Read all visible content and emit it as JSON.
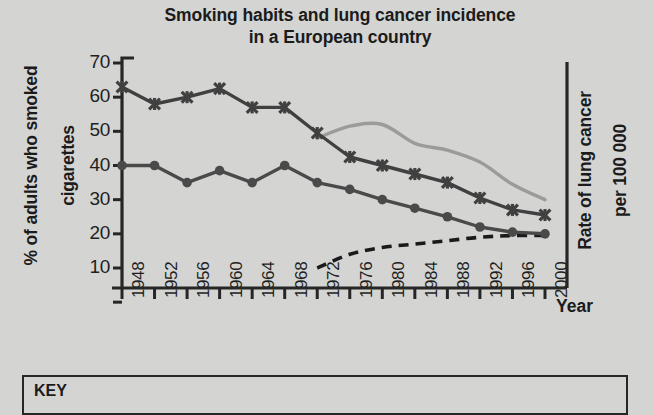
{
  "title": {
    "line1": "Smoking habits and lung cancer incidence",
    "line2": "in a European country"
  },
  "axes": {
    "left_title_line1": "% of adults who smoked",
    "left_title_line2": "cigarettes",
    "right_title_line1": "Rate of lung cancer",
    "right_title_line2": "per 100 000",
    "x_title": "Year"
  },
  "key": {
    "label": "KEY"
  },
  "chart_data": {
    "type": "line",
    "title": "Smoking habits and lung cancer incidence in a European country",
    "xlabel": "Year",
    "ylabel": "% of adults who smoked cigarettes",
    "ylabel_right": "Rate of lung cancer per 100 000",
    "grid": false,
    "legend_position": "bottom-key-box",
    "x": [
      1948,
      1952,
      1956,
      1960,
      1964,
      1968,
      1972,
      1976,
      1980,
      1984,
      1988,
      1992,
      1996,
      2000
    ],
    "xtick_labels": [
      "1948",
      "1952",
      "1956",
      "1960",
      "1964",
      "1968",
      "1972",
      "1976",
      "1980",
      "1984",
      "1988",
      "1992",
      "1996",
      "2000"
    ],
    "ylim": [
      0,
      74
    ],
    "ytick_labels": [
      "70",
      "60",
      "50",
      "40",
      "30",
      "20",
      "10"
    ],
    "ytick_values": [
      70,
      60,
      50,
      40,
      30,
      20,
      10
    ],
    "right_axis_ticks_labelled": false,
    "series": [
      {
        "name": "men-smoking-percent",
        "marker": "cross",
        "color": "#404040",
        "style": "solid",
        "x": [
          1948,
          1952,
          1956,
          1960,
          1964,
          1968,
          1972,
          1976,
          1980,
          1984,
          1988,
          1992,
          1996,
          2000
        ],
        "values": [
          63,
          58,
          60,
          62.5,
          57,
          57,
          49.5,
          42.5,
          40,
          37.5,
          35,
          30.5,
          27,
          25.5
        ]
      },
      {
        "name": "women-smoking-percent",
        "marker": "circle",
        "color": "#4a4a4a",
        "style": "solid",
        "x": [
          1948,
          1952,
          1956,
          1960,
          1964,
          1968,
          1972,
          1976,
          1980,
          1984,
          1988,
          1992,
          1996,
          2000
        ],
        "values": [
          40,
          40,
          35,
          38.5,
          35,
          40,
          35,
          33,
          30,
          27.5,
          25,
          22,
          20.5,
          20
        ]
      },
      {
        "name": "men-lung-cancer-rate",
        "marker": "none",
        "color": "#9b9b99",
        "style": "solid",
        "x": [
          1972,
          1976,
          1980,
          1984,
          1988,
          1992,
          1996,
          2000
        ],
        "values": [
          48,
          51.5,
          52,
          46.5,
          44.5,
          41,
          34.5,
          30
        ]
      },
      {
        "name": "women-lung-cancer-rate",
        "marker": "none",
        "color": "#1a1a1a",
        "style": "dashed",
        "x": [
          1972,
          1976,
          1980,
          1984,
          1988,
          1992,
          1996,
          2000
        ],
        "values": [
          10,
          14,
          16,
          17,
          18,
          19,
          19.5,
          19.5
        ]
      }
    ]
  }
}
